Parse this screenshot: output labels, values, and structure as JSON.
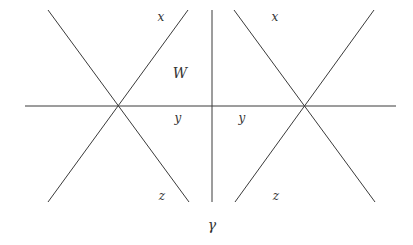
{
  "diagram": {
    "stroke_color": "#3a3a3a",
    "lines": [
      {
        "id": "horizontal-axis",
        "x1": 25,
        "y1": 106,
        "x2": 396,
        "y2": 106
      },
      {
        "id": "vertical-divider",
        "x1": 212,
        "y1": 10,
        "x2": 212,
        "y2": 202
      },
      {
        "id": "left-x-diag-1",
        "x1": 48,
        "y1": 10,
        "x2": 189,
        "y2": 202
      },
      {
        "id": "left-x-diag-2",
        "x1": 188,
        "y1": 10,
        "x2": 48,
        "y2": 202
      },
      {
        "id": "right-x-diag-1",
        "x1": 234,
        "y1": 10,
        "x2": 375,
        "y2": 202
      },
      {
        "id": "right-x-diag-2",
        "x1": 374,
        "y1": 10,
        "x2": 235,
        "y2": 202
      }
    ],
    "labels": {
      "left_x": {
        "text": "x",
        "x": 161,
        "y": 17
      },
      "right_x": {
        "text": "x",
        "x": 275,
        "y": 17
      },
      "W": {
        "text": "W",
        "x": 180,
        "y": 73
      },
      "left_y": {
        "text": "y",
        "x": 178,
        "y": 118
      },
      "right_y": {
        "text": "y",
        "x": 242,
        "y": 118
      },
      "left_z": {
        "text": "z",
        "x": 162,
        "y": 196
      },
      "right_z": {
        "text": "z",
        "x": 276,
        "y": 196
      },
      "gamma": {
        "text": "γ",
        "x": 212,
        "y": 225
      }
    }
  }
}
